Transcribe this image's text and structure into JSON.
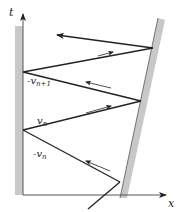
{
  "diagram": {
    "axes": {
      "vertical_label": "t",
      "horizontal_label": "x"
    },
    "labels": {
      "neg_v_n_plus_1": "-v",
      "neg_v_n_plus_1_sub": "n+1",
      "v_n": "v",
      "v_n_sub": "n",
      "neg_v_n": "-v",
      "neg_v_n_sub": "n"
    },
    "colors": {
      "wall": "#c8c8c8",
      "line": "#222222",
      "background": "#ffffff"
    },
    "elements": {
      "left_wall": "fixed wall",
      "right_wall": "moving wall",
      "trajectory": "zigzag bouncing path with arrows"
    }
  }
}
